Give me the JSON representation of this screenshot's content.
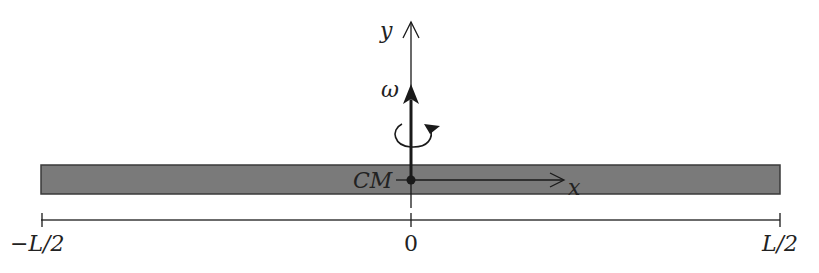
{
  "diagram": {
    "type": "rigid-rod-rotation",
    "rod": {
      "fill": "#7a7a7a",
      "stroke": "#3a3a3a"
    },
    "labels": {
      "y_axis": "y",
      "x_axis": "x",
      "omega": "ω",
      "center_of_mass": "CM",
      "left_end": "−L/2",
      "center": "0",
      "right_end": "L/2"
    },
    "colors": {
      "ink": "#1a1a1a",
      "rod": "#7a7a7a"
    }
  }
}
